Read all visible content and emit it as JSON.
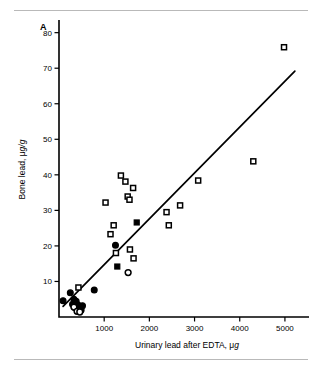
{
  "figure": {
    "panel_label": "A"
  },
  "chart_data": {
    "type": "scatter",
    "title": "",
    "xlabel": "Urinary lead after EDTA, μg",
    "ylabel": "Bone lead, μg/g",
    "xlim": [
      0,
      5400
    ],
    "ylim": [
      0,
      83
    ],
    "xticks": [
      1000,
      2000,
      3000,
      4000,
      5000
    ],
    "xticklabels": [
      "1000",
      "2000",
      "3000",
      "4000",
      "5000"
    ],
    "yticks": [
      10,
      20,
      30,
      40,
      50,
      60,
      70,
      80
    ],
    "yticklabels": [
      "10",
      "20",
      "30",
      "40",
      "50",
      "60",
      "70",
      "80"
    ],
    "grid": false,
    "legend": "none",
    "fit_line": {
      "label": "regression line",
      "x0": 90,
      "y0": 3.0,
      "x1": 5220,
      "y1": 69.2
    },
    "series": [
      {
        "name": "open-square",
        "marker": "square-open",
        "points": [
          [
            1030,
            32.2
          ],
          [
            1140,
            23.3
          ],
          [
            1210,
            25.8
          ],
          [
            1260,
            18.0
          ],
          [
            1370,
            39.8
          ],
          [
            1470,
            38.1
          ],
          [
            1520,
            33.9
          ],
          [
            1560,
            33.0
          ],
          [
            1640,
            36.3
          ],
          [
            1570,
            19.0
          ],
          [
            1650,
            16.5
          ],
          [
            2380,
            29.5
          ],
          [
            2430,
            25.8
          ],
          [
            2680,
            31.4
          ],
          [
            3080,
            38.4
          ],
          [
            4300,
            43.8
          ],
          [
            4980,
            75.9
          ],
          [
            430,
            8.3
          ]
        ]
      },
      {
        "name": "filled-square",
        "marker": "square-filled",
        "points": [
          [
            1290,
            14.2
          ],
          [
            1720,
            26.6
          ]
        ]
      },
      {
        "name": "filled-circle",
        "marker": "circle-filled",
        "points": [
          [
            1250,
            20.2
          ],
          [
            780,
            7.6
          ],
          [
            250,
            6.8
          ],
          [
            90,
            4.6
          ],
          [
            330,
            5.0
          ],
          [
            380,
            4.4
          ],
          [
            300,
            3.6
          ],
          [
            420,
            3.4
          ],
          [
            470,
            3.0
          ],
          [
            520,
            3.2
          ],
          [
            440,
            2.3
          ],
          [
            360,
            2.6
          ],
          [
            490,
            2.0
          ]
        ]
      },
      {
        "name": "open-circle",
        "marker": "circle-open",
        "points": [
          [
            1530,
            12.5
          ],
          [
            330,
            2.8
          ],
          [
            400,
            1.6
          ],
          [
            460,
            1.4
          ]
        ]
      }
    ]
  }
}
